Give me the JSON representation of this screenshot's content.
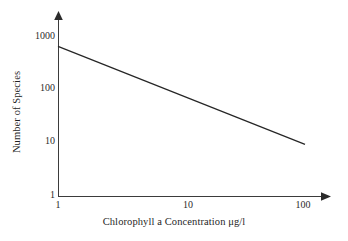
{
  "chart_data": {
    "type": "line",
    "title": "",
    "subtitle": "",
    "xlabel": "Chlorophyll a Concentration μg/l",
    "ylabel": "Number of Species",
    "xscale": "log",
    "yscale": "log",
    "xlim": [
      1,
      100
    ],
    "ylim": [
      1,
      1000
    ],
    "xticks": [
      1,
      10,
      100
    ],
    "xticklabels": [
      "1",
      "10",
      "100"
    ],
    "yticks": [
      1,
      10,
      100,
      1000
    ],
    "yticklabels": [
      "1",
      "10",
      "100",
      "1000"
    ],
    "grid": false,
    "legend": false,
    "legend_position": "none",
    "annotations": [],
    "series": [
      {
        "name": "Species richness vs chlorophyll a",
        "x": [
          1,
          100
        ],
        "y": [
          750,
          10
        ],
        "color": "#262626",
        "linewidth": 1.25,
        "markers": false
      }
    ]
  },
  "axes": {
    "x_axis_name": "x-axis",
    "y_axis_name": "y-axis",
    "x_arrow": "arrow-right",
    "y_arrow": "arrow-up",
    "axis_color": "#3b3b3b"
  },
  "figure": {
    "background": "#ffffff",
    "width": 348,
    "height": 241
  }
}
